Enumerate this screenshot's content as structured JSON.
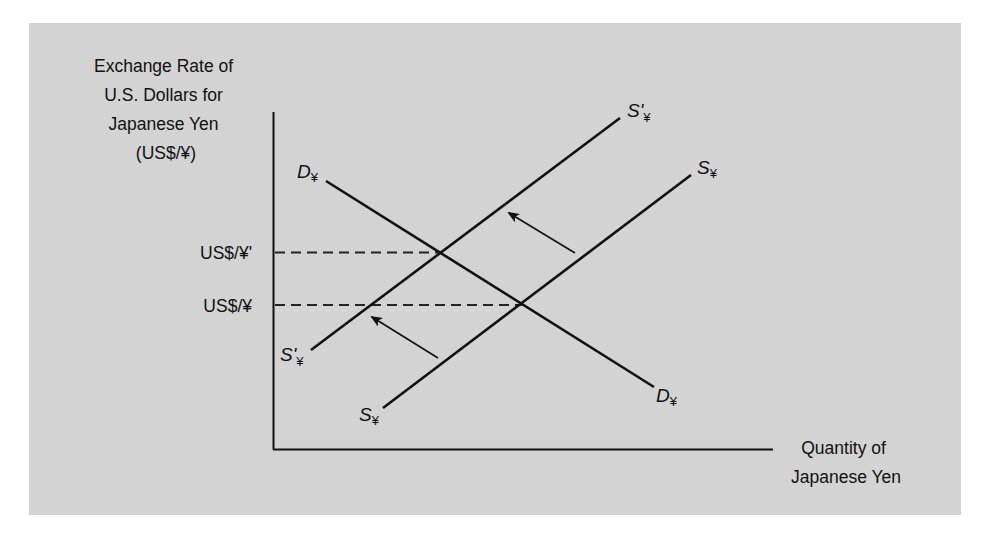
{
  "diagram": {
    "type": "supply-demand",
    "y_axis_label": [
      "Exchange Rate of",
      "U.S. Dollars for",
      "Japanese Yen",
      "(US$/¥)"
    ],
    "x_axis_label": [
      "Quantity of",
      "Japanese Yen"
    ],
    "ticks": {
      "upper": "US$/¥'",
      "lower": "US$/¥"
    },
    "curves": {
      "demand": {
        "main": "D",
        "sub": "¥"
      },
      "supply": {
        "main": "S",
        "sub": "¥"
      },
      "supply_shifted": {
        "main": "S'",
        "sub": "¥"
      }
    },
    "annotations": [
      "Leftward shift arrow (supply decreases)",
      "Leftward shift arrow (supply decreases)"
    ],
    "colors": {
      "background": "#d3d3d3",
      "ink": "#111111"
    }
  }
}
